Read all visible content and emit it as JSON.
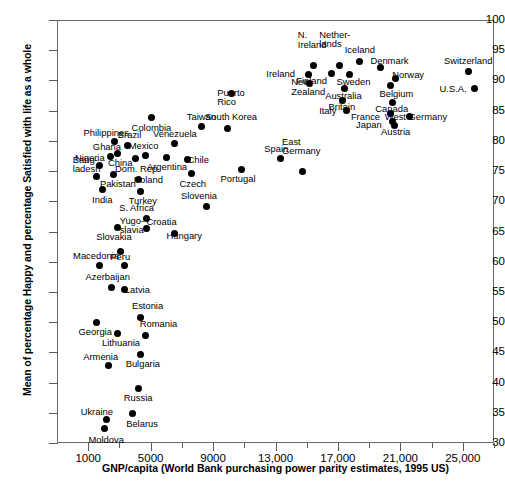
{
  "chart_data": {
    "type": "scatter",
    "title": "",
    "xlabel": "GNP/capita (World Bank purchasing power parity estimates, 1995 US)",
    "ylabel": "Mean of percentage Happy and percentage Satisfied with life as a whole",
    "xlim": [
      -1000,
      27000
    ],
    "ylim": [
      30,
      100
    ],
    "xticks": [
      1000,
      5000,
      9000,
      13000,
      17000,
      21000,
      25000
    ],
    "xtick_labels": [
      "1000",
      "5000",
      "9000",
      "13,000",
      "17,000",
      "21,000",
      "25,000"
    ],
    "xticks_minor": [
      3000,
      7000,
      11000,
      15000,
      19000,
      23000,
      27000
    ],
    "yticks": [
      30,
      35,
      40,
      45,
      50,
      55,
      60,
      65,
      70,
      75,
      80,
      85,
      90,
      95,
      100
    ],
    "grid": false,
    "legend": "none",
    "marker_color": "#000000",
    "points": [
      {
        "label": "Moldova",
        "x": 2050,
        "y": 32.4,
        "lx": 2150,
        "ly": 30.5,
        "align": "c"
      },
      {
        "label": "Ukraine",
        "x": 2200,
        "y": 33.9,
        "lx": 1550,
        "ly": 35.1,
        "align": "c"
      },
      {
        "label": "Belarus",
        "x": 3850,
        "y": 34.8,
        "lx": 4450,
        "ly": 33.2,
        "align": "c"
      },
      {
        "label": "Russia",
        "x": 4200,
        "y": 39.1,
        "lx": 4200,
        "ly": 37.4,
        "align": "c"
      },
      {
        "label": "Armenia",
        "x": 2300,
        "y": 42.9,
        "lx": 1800,
        "ly": 44.3,
        "align": "c"
      },
      {
        "label": "Bulgaria",
        "x": 4350,
        "y": 44.7,
        "lx": 4500,
        "ly": 43.1,
        "align": "c"
      },
      {
        "label": "Georgia",
        "x": 1500,
        "y": 50.0,
        "lx": 1450,
        "ly": 48.3,
        "align": "c"
      },
      {
        "label": "Lithuania",
        "x": 2900,
        "y": 48.2,
        "lx": 3100,
        "ly": 46.5,
        "align": "c"
      },
      {
        "label": "Romania",
        "x": 4700,
        "y": 47.8,
        "lx": 5500,
        "ly": 49.7,
        "align": "c"
      },
      {
        "label": "Estonia",
        "x": 4350,
        "y": 50.8,
        "lx": 4800,
        "ly": 52.6,
        "align": "c"
      },
      {
        "label": "Azerbaijan",
        "x": 2500,
        "y": 55.8,
        "lx": 2250,
        "ly": 57.5,
        "align": "c"
      },
      {
        "label": "Latvia",
        "x": 3350,
        "y": 55.4,
        "lx": 4150,
        "ly": 55.4,
        "align": "c"
      },
      {
        "label": "Macedonia",
        "x": 1700,
        "y": 59.3,
        "lx": 1500,
        "ly": 60.9,
        "align": "c"
      },
      {
        "label": "Peru",
        "x": 3350,
        "y": 59.4,
        "lx": 3050,
        "ly": 60.8,
        "align": "c"
      },
      {
        "label": "Yugo-\nslavia",
        "x": 3100,
        "y": 61.7,
        "lx": 3800,
        "ly": 65.2,
        "align": "c"
      },
      {
        "label": "Slovakia",
        "x": 2850,
        "y": 65.7,
        "lx": 2650,
        "ly": 64.1,
        "align": "c"
      },
      {
        "label": "Hungary",
        "x": 6500,
        "y": 64.6,
        "lx": 7150,
        "ly": 64.2,
        "align": "c"
      },
      {
        "label": "Croatia",
        "x": 4750,
        "y": 65.5,
        "lx": 5700,
        "ly": 66.6,
        "align": "c"
      },
      {
        "label": "S. Africa",
        "x": 4750,
        "y": 67.2,
        "lx": 4100,
        "ly": 68.9,
        "align": "c"
      },
      {
        "label": "Slovenia",
        "x": 8600,
        "y": 69.1,
        "lx": 8100,
        "ly": 70.8,
        "align": "c"
      },
      {
        "label": "India",
        "x": 1900,
        "y": 71.9,
        "lx": 1900,
        "ly": 70.2,
        "align": "c"
      },
      {
        "label": "Turkey",
        "x": 4350,
        "y": 71.7,
        "lx": 4500,
        "ly": 70.1,
        "align": "c"
      },
      {
        "label": "Bang-\nladesh",
        "x": 1550,
        "y": 74.1,
        "lx": 900,
        "ly": 75.3,
        "align": "c"
      },
      {
        "label": "Pakistan",
        "x": 2650,
        "y": 74.4,
        "lx": 2900,
        "ly": 72.8,
        "align": "c"
      },
      {
        "label": "Poland",
        "x": 4200,
        "y": 73.6,
        "lx": 4850,
        "ly": 73.6,
        "align": "c"
      },
      {
        "label": "Czech",
        "x": 7600,
        "y": 74.6,
        "lx": 7700,
        "ly": 72.9,
        "align": "c"
      },
      {
        "label": "Portugal",
        "x": 10800,
        "y": 75.3,
        "lx": 10600,
        "ly": 73.7,
        "align": "c"
      },
      {
        "label": "Nigeria",
        "x": 1750,
        "y": 75.9,
        "lx": 1100,
        "ly": 77.1,
        "align": "c"
      },
      {
        "label": "East\nGermany",
        "x": 14700,
        "y": 74.9,
        "lx": 14650,
        "ly": 78.3,
        "align": "c"
      },
      {
        "label": "Spain",
        "x": 13350,
        "y": 77.0,
        "lx": 13050,
        "ly": 78.6,
        "align": "c"
      },
      {
        "label": "Ghana",
        "x": 2400,
        "y": 77.4,
        "lx": 2200,
        "ly": 79.0,
        "align": "c"
      },
      {
        "label": "China",
        "x": 2900,
        "y": 77.9,
        "lx": 3050,
        "ly": 76.3,
        "align": "c"
      },
      {
        "label": "Dom. Rep.",
        "x": 4000,
        "y": 77.0,
        "lx": 4150,
        "ly": 75.4,
        "align": "c"
      },
      {
        "label": "Mexico",
        "x": 4700,
        "y": 77.6,
        "lx": 4550,
        "ly": 79.2,
        "align": "c"
      },
      {
        "label": "Argentina",
        "x": 6000,
        "y": 77.2,
        "lx": 6050,
        "ly": 75.6,
        "align": "c"
      },
      {
        "label": "Chile",
        "x": 7350,
        "y": 76.9,
        "lx": 8050,
        "ly": 76.9,
        "align": "c"
      },
      {
        "label": "Philippines",
        "x": 2700,
        "y": 79.9,
        "lx": 2150,
        "ly": 81.3,
        "align": "c"
      },
      {
        "label": "Brazil",
        "x": 3500,
        "y": 79.2,
        "lx": 3650,
        "ly": 80.9,
        "align": "c"
      },
      {
        "label": "Venezuela",
        "x": 6550,
        "y": 79.5,
        "lx": 6550,
        "ly": 81.2,
        "align": "c"
      },
      {
        "label": "Colombia",
        "x": 5050,
        "y": 83.9,
        "lx": 5050,
        "ly": 82.2,
        "align": "c"
      },
      {
        "label": "Taiwan",
        "x": 8250,
        "y": 82.3,
        "lx": 8250,
        "ly": 84.0,
        "align": "c"
      },
      {
        "label": "South Korea",
        "x": 9950,
        "y": 82.0,
        "lx": 10150,
        "ly": 84.0,
        "align": "c"
      },
      {
        "label": "Puerto\nRico",
        "x": 10200,
        "y": 87.9,
        "lx": 10150,
        "ly": 86.4,
        "align": "c"
      },
      {
        "label": "Ireland",
        "x": 15100,
        "y": 91.0,
        "lx": 14250,
        "ly": 91.1,
        "align": "r"
      },
      {
        "label": "N.\nIreland",
        "x": 15450,
        "y": 92.5,
        "lx": 15350,
        "ly": 95.9,
        "align": "c"
      },
      {
        "label": "New\nZealand",
        "x": 15200,
        "y": 89.5,
        "lx": 15100,
        "ly": 88.1,
        "align": "c"
      },
      {
        "label": "Finland",
        "x": 16600,
        "y": 91.1,
        "lx": 16300,
        "ly": 89.9,
        "align": "r"
      },
      {
        "label": "Nether-\nlands",
        "x": 17100,
        "y": 92.4,
        "lx": 16800,
        "ly": 96.0,
        "align": "c"
      },
      {
        "label": "Sweden",
        "x": 17750,
        "y": 90.9,
        "lx": 18000,
        "ly": 89.8,
        "align": "c"
      },
      {
        "label": "Iceland",
        "x": 18400,
        "y": 93.2,
        "lx": 18400,
        "ly": 95.1,
        "align": "c"
      },
      {
        "label": "Australia",
        "x": 17400,
        "y": 88.6,
        "lx": 17350,
        "ly": 87.5,
        "align": "c"
      },
      {
        "label": "Britain",
        "x": 17300,
        "y": 86.7,
        "lx": 17250,
        "ly": 85.6,
        "align": "c"
      },
      {
        "label": "Italy",
        "x": 17550,
        "y": 85.0,
        "lx": 16900,
        "ly": 84.9,
        "align": "r"
      },
      {
        "label": "Denmark",
        "x": 19700,
        "y": 92.1,
        "lx": 20300,
        "ly": 93.2,
        "align": "c"
      },
      {
        "label": "Norway",
        "x": 20700,
        "y": 90.3,
        "lx": 21500,
        "ly": 90.9,
        "align": "c"
      },
      {
        "label": "Belgium",
        "x": 20350,
        "y": 89.1,
        "lx": 20750,
        "ly": 87.7,
        "align": "c"
      },
      {
        "label": "Canada",
        "x": 20500,
        "y": 86.4,
        "lx": 20450,
        "ly": 85.2,
        "align": "c"
      },
      {
        "label": "France",
        "x": 20400,
        "y": 84.6,
        "lx": 19700,
        "ly": 84.0,
        "align": "r"
      },
      {
        "label": "West Germany",
        "x": 21600,
        "y": 84.0,
        "lx": 22000,
        "ly": 84.0,
        "align": "c"
      },
      {
        "label": "Japan",
        "x": 20500,
        "y": 83.2,
        "lx": 19800,
        "ly": 82.6,
        "align": "r"
      },
      {
        "label": "Austria",
        "x": 20650,
        "y": 82.6,
        "lx": 20700,
        "ly": 81.4,
        "align": "c"
      },
      {
        "label": "Switzerland",
        "x": 25350,
        "y": 91.4,
        "lx": 25350,
        "ly": 93.2,
        "align": "c"
      },
      {
        "label": "U.S.A.",
        "x": 25750,
        "y": 88.6,
        "lx": 25250,
        "ly": 88.6,
        "align": "r"
      }
    ]
  }
}
